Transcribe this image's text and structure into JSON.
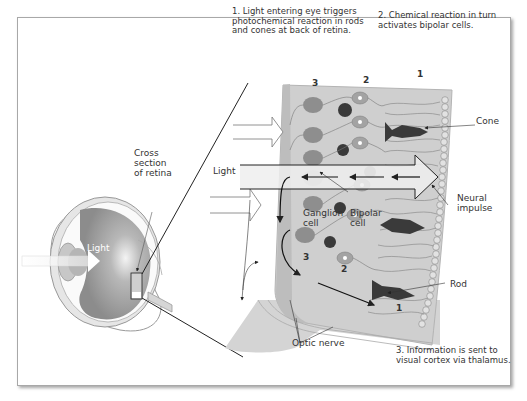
{
  "captions": {
    "step1": "1. Light entering eye triggers\nphotochemical reaction in rods\nand cones at back of retina.",
    "step2": "2. Chemical reaction in turn\nactivates bipolar cells.",
    "step3": "3. Information is sent to\nvisual cortex via thalamus."
  },
  "labels": {
    "cross_section": "Cross\nsection\nof retina",
    "light_eye": "Light",
    "light_retina": "Light",
    "cone": "Cone",
    "neural_impulse": "Neural\nimpulse",
    "ganglion_cell": "Ganglion\ncell",
    "bipolar_cell": "Bipolar\ncell",
    "rod": "Rod",
    "optic_nerve": "Optic nerve"
  },
  "layer_numbers": {
    "top_3": "3",
    "top_2": "2",
    "top_1": "1",
    "bottom_3": "3",
    "bottom_2": "2",
    "bottom_1": "1"
  },
  "colors": {
    "retina_bg": "#cfcfcf",
    "ganglion": "#8a8a8a",
    "bipolar": "#a0a0a0",
    "dark_cell": "#3a3a3a",
    "line": "#333333"
  }
}
